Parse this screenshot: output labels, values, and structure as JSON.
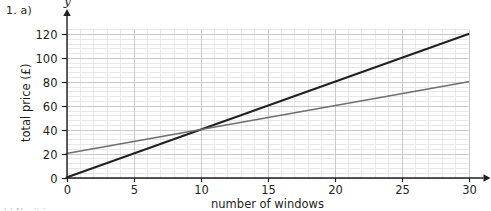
{
  "question_label": "1. a)",
  "bottom_partial_text": "b) No, it is...",
  "chart_data": {
    "type": "line",
    "title": "",
    "xlabel": "number of windows",
    "ylabel": "total price (£)",
    "x_axis_variable": "x",
    "y_axis_variable": "y",
    "xlim": [
      0,
      30
    ],
    "ylim": [
      0,
      125
    ],
    "x_ticks": [
      0,
      5,
      10,
      15,
      20,
      25,
      30
    ],
    "y_ticks": [
      0,
      20,
      40,
      60,
      80,
      100,
      120
    ],
    "x_tick_labels": [
      "0",
      "5",
      "10",
      "15",
      "20",
      "25",
      "30"
    ],
    "y_tick_labels": [
      "0",
      "20",
      "40",
      "60",
      "80",
      "100",
      "120"
    ],
    "grid": true,
    "minor_grid": true,
    "minor_grid_per_major": 5,
    "legend": false,
    "legend_position": "none",
    "intersection": {
      "x": 10,
      "y": 40
    },
    "series": [
      {
        "name": "line-a",
        "color": "#231f20",
        "width": 2.0,
        "intercept": 0,
        "slope": 4,
        "x": [
          0,
          30
        ],
        "values": [
          0,
          120
        ]
      },
      {
        "name": "line-b",
        "color": "#6f6f6f",
        "width": 1.5,
        "intercept": 20,
        "slope": 2,
        "x": [
          0,
          30
        ],
        "values": [
          20,
          80
        ]
      }
    ]
  },
  "colors": {
    "axis": "#231f20",
    "major_grid": "#c9c9c9",
    "minor_grid": "#e8e8e8",
    "background": "#ffffff"
  }
}
